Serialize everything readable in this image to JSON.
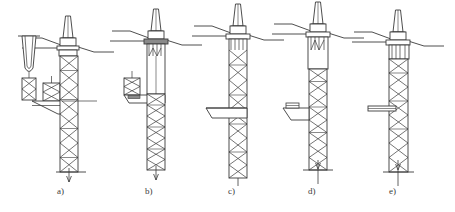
{
  "figure": {
    "type": "technical-diagram",
    "panel_count": 5,
    "line_color": "#3a3a3a",
    "fill_color": "#ffffff",
    "shade_color": "#8a8a8a",
    "background": "#ffffff"
  },
  "panels": [
    {
      "id": "a",
      "caption": "a)",
      "caption_x": 62,
      "caption_y": 192,
      "origin_x": 68,
      "stage": "tower-section-suspended-beside-jacket",
      "has_rotor": true,
      "has_nacelle": true,
      "has_tapered_tower": true,
      "has_suspended_tower_section": true,
      "has_suspended_lattice_piece": true,
      "has_wedge_barge": true,
      "has_jacket": true,
      "jacket_bays": 8,
      "has_seabed_line": true,
      "has_pile_arrow": true,
      "waterline_y": 62,
      "seabed_y": 172
    },
    {
      "id": "b",
      "caption": "b)",
      "caption_x": 150,
      "caption_y": 192,
      "origin_x": 156,
      "stage": "tower-landed-on-transition-piece",
      "has_rotor": true,
      "has_nacelle": true,
      "has_tapered_tower": true,
      "has_shaded_hub_ring": true,
      "has_wedge_barge": true,
      "has_side_lattice_block": true,
      "has_jacket": true,
      "jacket_bays": 7,
      "has_seabed_line": true,
      "has_pile_arrow": true,
      "waterline_y": 55,
      "seabed_y": 170
    },
    {
      "id": "c",
      "caption": "c)",
      "caption_x": 232,
      "caption_y": 192,
      "origin_x": 238,
      "stage": "jacket-lowered-through-water-column",
      "has_rotor": true,
      "has_nacelle": true,
      "has_tapered_tower": true,
      "has_wedge_barge": true,
      "has_jacket": true,
      "jacket_bays": 9,
      "has_seabed_line": false,
      "has_pile_arrow": true,
      "waterline_y": 50,
      "seabed_y": 178
    },
    {
      "id": "d",
      "caption": "d)",
      "caption_x": 312,
      "caption_y": 192,
      "origin_x": 318,
      "stage": "jacket-seated-with-support-frame",
      "has_rotor": true,
      "has_nacelle": true,
      "has_tapered_tower": true,
      "has_wedge_barge": true,
      "has_jacket": true,
      "jacket_bays": 8,
      "has_seabed_line": true,
      "has_pile_arrow": true,
      "waterline_y": 48,
      "seabed_y": 170
    },
    {
      "id": "e",
      "caption": "e)",
      "caption_x": 392,
      "caption_y": 192,
      "origin_x": 398,
      "stage": "piles-driven-installation-complete",
      "has_rotor": true,
      "has_nacelle": true,
      "has_tapered_tower": true,
      "has_horizontal_arm": true,
      "has_wedge_barge": false,
      "has_jacket": true,
      "jacket_bays": 8,
      "has_seabed_line": true,
      "has_pile_arrow": true,
      "waterline_y": 56,
      "seabed_y": 172
    }
  ]
}
